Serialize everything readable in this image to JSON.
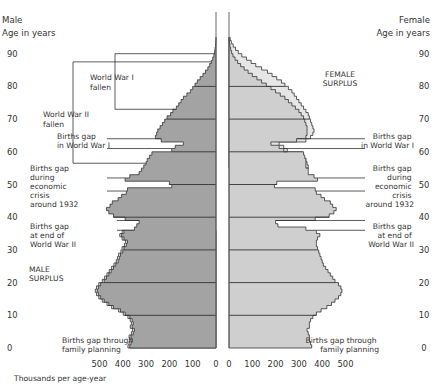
{
  "chart_data": {
    "type": "bar",
    "subtype": "population-pyramid",
    "title": "",
    "left_header": [
      "Male",
      "Age in years"
    ],
    "right_header": [
      "Female",
      "Age in years"
    ],
    "xlabel": "Thousands per age-year",
    "age_ticks": [
      "0",
      "10",
      "20",
      "30",
      "40",
      "50",
      "60",
      "70",
      "80",
      "90"
    ],
    "male_ticks": [
      "500",
      "400",
      "300",
      "200",
      "100",
      "0"
    ],
    "female_ticks": [
      "0",
      "100",
      "200",
      "300",
      "400",
      "500"
    ],
    "xlim": [
      0,
      500
    ],
    "ylim": [
      0,
      95
    ],
    "surplus_labels": {
      "male": [
        "MALE",
        "SURPLUS"
      ],
      "female": [
        "FEMALE",
        "SURPLUS"
      ]
    },
    "annotations_left": [
      {
        "id": "ww1-fallen",
        "lines": [
          "World War I",
          "fallen"
        ]
      },
      {
        "id": "ww2-fallen",
        "lines": [
          "World War II",
          "fallen"
        ]
      },
      {
        "id": "gap-ww1",
        "lines": [
          "Births gap",
          "in World War I"
        ]
      },
      {
        "id": "gap-1932",
        "lines": [
          "Births gap",
          "during",
          "economic",
          "crisis",
          "around 1932"
        ]
      },
      {
        "id": "gap-ww2",
        "lines": [
          "Births gap",
          "at end of",
          "World War II"
        ]
      },
      {
        "id": "gap-planning",
        "lines": [
          "Births gap through",
          "family planning"
        ]
      }
    ],
    "annotations_right": [
      {
        "id": "gap-ww1",
        "lines": [
          "Births gap",
          "in World War I"
        ]
      },
      {
        "id": "gap-1932",
        "lines": [
          "Births gap",
          "during",
          "economic",
          "crisis",
          "around 1932"
        ]
      },
      {
        "id": "gap-ww2",
        "lines": [
          "Births gap",
          "at end of",
          "World War II"
        ]
      },
      {
        "id": "gap-planning",
        "lines": [
          "Births gap through",
          "family planning"
        ]
      }
    ],
    "series": [
      {
        "name": "Male",
        "color": "#a3a3a3",
        "ages_from": 0,
        "values": [
          370,
          365,
          360,
          365,
          355,
          350,
          360,
          355,
          360,
          370,
          390,
          410,
          440,
          460,
          480,
          495,
          505,
          510,
          505,
          495,
          480,
          470,
          460,
          450,
          440,
          430,
          420,
          415,
          410,
          400,
          395,
          385,
          380,
          395,
          405,
          395,
          350,
          340,
          330,
          390,
          440,
          460,
          470,
          455,
          445,
          420,
          405,
          385,
          380,
          190,
          200,
          390,
          370,
          330,
          320,
          310,
          300,
          295,
          285,
          275,
          190,
          175,
          140,
          235,
          260,
          255,
          250,
          240,
          230,
          220,
          210,
          195,
          185,
          170,
          160,
          150,
          140,
          125,
          110,
          100,
          90,
          80,
          68,
          56,
          45,
          35,
          27,
          20,
          14,
          9,
          6,
          4,
          2,
          1,
          0
        ]
      },
      {
        "name": "Female",
        "color": "#cfcfcf",
        "ages_from": 0,
        "values": [
          355,
          350,
          345,
          345,
          340,
          335,
          345,
          345,
          350,
          360,
          375,
          395,
          420,
          440,
          455,
          470,
          480,
          485,
          480,
          470,
          455,
          445,
          435,
          425,
          415,
          405,
          400,
          395,
          390,
          385,
          380,
          375,
          375,
          380,
          390,
          375,
          330,
          210,
          200,
          370,
          430,
          450,
          460,
          445,
          435,
          410,
          395,
          375,
          370,
          195,
          205,
          380,
          365,
          340,
          340,
          330,
          330,
          330,
          325,
          320,
          235,
          215,
          180,
          290,
          330,
          335,
          335,
          335,
          330,
          325,
          320,
          310,
          300,
          285,
          270,
          255,
          240,
          220,
          200,
          180,
          160,
          140,
          120,
          100,
          82,
          65,
          50,
          37,
          26,
          17,
          11,
          7,
          4,
          2,
          0
        ]
      },
      {
        "name": "Male surplus (outline over female side)",
        "note": "male outline extends beyond female on male side at ages 0-35"
      },
      {
        "name": "Female surplus",
        "color": "#e6e6e6",
        "ages_from": 55,
        "values": [
          340,
          335,
          330,
          320,
          315,
          250,
          235,
          215,
          330,
          350,
          360,
          365,
          360,
          355,
          350,
          345,
          340,
          330,
          320,
          310,
          300,
          290,
          280,
          270,
          255,
          240,
          225,
          205,
          185,
          165,
          140,
          115,
          95,
          75,
          55,
          40,
          28,
          18,
          10,
          5
        ]
      }
    ]
  }
}
